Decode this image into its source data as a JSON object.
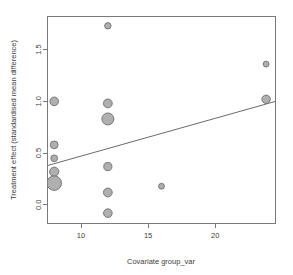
{
  "chart_data": {
    "type": "scatter",
    "title": "",
    "subtitle": "",
    "xlabel": "Covariate group_var",
    "ylabel": "Treatment effect (standardised mean difference)",
    "xlim": [
      7.5,
      24.5
    ],
    "ylim": [
      -0.18,
      1.82
    ],
    "xticks": [
      10,
      15,
      20
    ],
    "xtick_labels": [
      "10",
      "15",
      "20"
    ],
    "yticks": [
      0.0,
      0.5,
      1.0,
      1.5
    ],
    "ytick_labels": [
      "0.0",
      "0.5",
      "1.0",
      "1.5"
    ],
    "grid": false,
    "legend": "none",
    "marker": {
      "shape": "circle",
      "fill_color": "#a8a8a8",
      "edge_color": "#6e6e6e",
      "size_encodes": "study weight"
    },
    "points": [
      {
        "x": 12.0,
        "y": 1.73,
        "size": 3.2
      },
      {
        "x": 23.8,
        "y": 1.36,
        "size": 2.9
      },
      {
        "x": 23.8,
        "y": 1.02,
        "size": 4.2
      },
      {
        "x": 8.0,
        "y": 1.0,
        "size": 4.3
      },
      {
        "x": 12.0,
        "y": 0.98,
        "size": 4.4
      },
      {
        "x": 12.0,
        "y": 0.83,
        "size": 6.0
      },
      {
        "x": 8.0,
        "y": 0.58,
        "size": 3.9
      },
      {
        "x": 8.0,
        "y": 0.45,
        "size": 3.4
      },
      {
        "x": 12.0,
        "y": 0.37,
        "size": 4.1
      },
      {
        "x": 8.0,
        "y": 0.32,
        "size": 4.6
      },
      {
        "x": 8.0,
        "y": 0.21,
        "size": 7.3
      },
      {
        "x": 16.0,
        "y": 0.18,
        "size": 2.9
      },
      {
        "x": 12.0,
        "y": 0.12,
        "size": 4.4
      },
      {
        "x": 12.0,
        "y": -0.08,
        "size": 4.3
      }
    ],
    "regression_line": {
      "label": "fitted meta-regression line",
      "x_start": 7.5,
      "y_start": 0.38,
      "x_end": 24.5,
      "y_end": 1.0,
      "color": "#6b6b6b"
    }
  },
  "axes": {
    "frame_color": "#7a7a7a",
    "tick_color": "#7a7a7a",
    "label_color": "#3d3d3d"
  }
}
